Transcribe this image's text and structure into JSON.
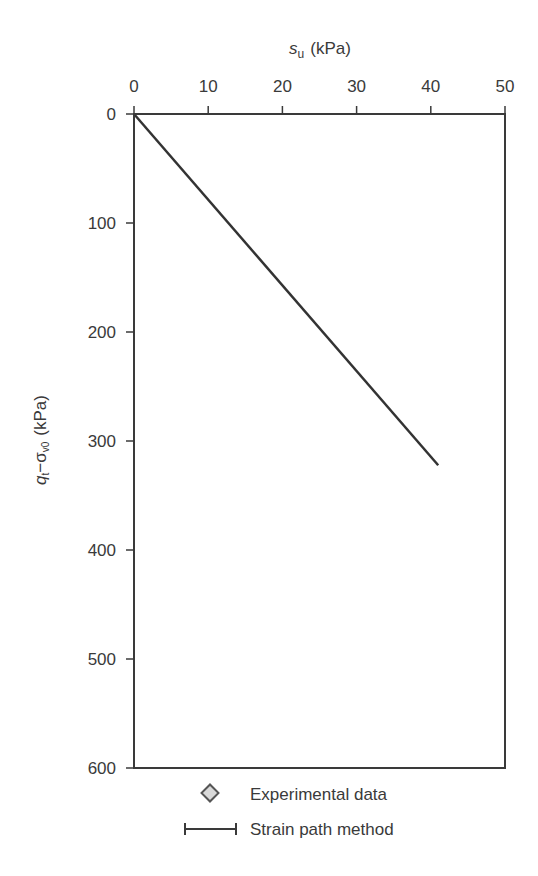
{
  "chart_data": {
    "type": "scatter",
    "title": "",
    "xlabel": "s_u (kPa)",
    "xlabel_main": "s",
    "xlabel_sub": "u",
    "xlabel_unit": "(kPa)",
    "ylabel": "q_t − σ_v0 (kPa)",
    "ylabel_q": "q",
    "ylabel_q_sub": "t",
    "ylabel_sigma": "−σ",
    "ylabel_sigma_sub": "v0",
    "ylabel_unit": "(kPa)",
    "x_axis_position": "top",
    "y_axis_inverted": true,
    "xlim": [
      0,
      50
    ],
    "ylim": [
      0,
      600
    ],
    "xticks": [
      0,
      10,
      20,
      30,
      40,
      50
    ],
    "yticks": [
      0,
      100,
      200,
      300,
      400,
      500,
      600
    ],
    "grid": false,
    "legend_position": "bottom",
    "series": [
      {
        "name": "Experimental data",
        "marker": "diamond",
        "fill": "#d9d9d9",
        "stroke": "#555555",
        "points": [
          [
            13,
            68
          ],
          [
            10,
            75
          ],
          [
            12,
            80
          ],
          [
            14,
            88
          ],
          [
            11,
            92
          ],
          [
            15,
            97
          ],
          [
            13,
            104
          ],
          [
            12,
            108
          ],
          [
            20,
            112
          ],
          [
            14,
            122
          ],
          [
            10,
            128
          ],
          [
            12,
            134
          ],
          [
            16,
            135
          ],
          [
            13,
            141
          ],
          [
            10,
            146
          ],
          [
            15,
            149
          ],
          [
            17,
            152
          ],
          [
            11,
            155
          ],
          [
            14,
            160
          ],
          [
            18,
            163
          ],
          [
            20,
            165
          ],
          [
            16,
            170
          ],
          [
            21,
            170
          ],
          [
            13,
            176
          ],
          [
            19,
            176
          ],
          [
            15,
            181
          ],
          [
            12,
            183
          ],
          [
            17,
            186
          ],
          [
            20,
            186
          ],
          [
            18,
            191
          ],
          [
            16,
            194
          ],
          [
            14,
            197
          ],
          [
            19,
            199
          ],
          [
            21,
            202
          ],
          [
            17,
            204
          ],
          [
            15,
            210
          ],
          [
            20,
            212
          ],
          [
            16,
            217
          ],
          [
            18,
            222
          ],
          [
            20,
            226
          ],
          [
            17,
            233
          ],
          [
            19,
            236
          ],
          [
            16,
            240
          ],
          [
            22,
            245
          ],
          [
            21,
            258
          ],
          [
            26,
            228
          ],
          [
            30,
            226
          ],
          [
            23,
            260
          ],
          [
            27,
            250
          ],
          [
            23,
            273
          ],
          [
            25,
            278
          ],
          [
            23,
            286
          ],
          [
            26,
            288
          ],
          [
            27,
            292
          ],
          [
            30,
            288
          ],
          [
            24,
            298
          ],
          [
            26,
            304
          ],
          [
            25,
            313
          ],
          [
            27,
            320
          ],
          [
            31,
            320
          ],
          [
            25,
            333
          ],
          [
            24,
            343
          ],
          [
            27,
            342
          ],
          [
            31,
            345
          ],
          [
            24,
            360
          ],
          [
            29,
            368
          ],
          [
            32,
            363
          ],
          [
            31,
            373
          ],
          [
            24,
            372
          ],
          [
            23,
            385
          ],
          [
            26,
            395
          ],
          [
            28,
            395
          ],
          [
            32,
            390
          ],
          [
            31,
            398
          ],
          [
            32,
            410
          ],
          [
            32,
            418
          ],
          [
            24,
            425
          ],
          [
            24,
            440
          ],
          [
            32,
            440
          ],
          [
            32,
            452
          ],
          [
            32,
            464
          ],
          [
            26,
            484
          ],
          [
            27,
            484
          ],
          [
            32,
            476
          ],
          [
            31,
            481
          ]
        ]
      },
      {
        "name": "Strain path method",
        "marker": "errorbar",
        "stroke": "#3a3a3a",
        "bars": [
          {
            "y": 100,
            "x_min": 7.5,
            "x_max": 14
          },
          {
            "y": 140,
            "x_min": 14,
            "x_max": 19
          },
          {
            "y": 200,
            "x_min": 14,
            "x_max": 23
          }
        ]
      }
    ],
    "reference_lines": [
      {
        "label_main": "N",
        "label_sub": "kt",
        "label_value": "=8",
        "nkt": 8,
        "style": "solid-then-dashed",
        "end": [
          50,
          393
        ],
        "label_at": [
          39.5,
          350
        ]
      },
      {
        "label_main": "N",
        "label_sub": "kt",
        "label_value": "=12",
        "nkt": 12,
        "style": "dashed",
        "end": [
          50,
          575
        ],
        "label_at": [
          37,
          485
        ]
      },
      {
        "label_main": "N",
        "label_sub": "kt",
        "label_value": "=16",
        "nkt": 16,
        "style": "solid-then-dashed",
        "end": [
          40.3,
          600
        ],
        "label_at": [
          27.5,
          545
        ]
      }
    ],
    "legend": [
      {
        "symbol": "diamond",
        "label": "Experimental data"
      },
      {
        "symbol": "errorbar",
        "label": "Strain path method"
      }
    ]
  },
  "colors": {
    "axis": "#3a3a3a",
    "marker_fill": "#d9d9d9",
    "marker_stroke": "#555555",
    "line": "#333333",
    "background": "#ffffff"
  }
}
